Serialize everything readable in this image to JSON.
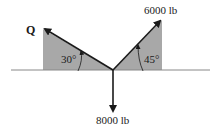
{
  "diagram": {
    "type": "force-diagram",
    "forces": [
      {
        "name": "Q",
        "label": "Q",
        "angle_deg": 30,
        "direction": "up-left",
        "angle_label": "30°"
      },
      {
        "name": "F1",
        "label": "6000 lb",
        "angle_deg": 45,
        "direction": "up-right",
        "angle_label": "45°"
      },
      {
        "name": "F2",
        "label": "8000 lb",
        "direction": "down"
      }
    ],
    "colors": {
      "shade": "#a8a8a8",
      "line": "#1a1a1a",
      "ground": "#888888"
    }
  }
}
